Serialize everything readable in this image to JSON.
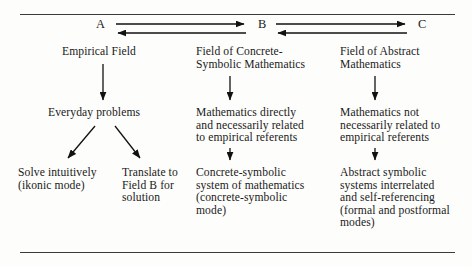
{
  "figure": {
    "axis_letters": [
      {
        "name": "A",
        "label": "A"
      },
      {
        "name": "B",
        "label": "B"
      },
      {
        "name": "C",
        "label": "C"
      }
    ],
    "columns": [
      {
        "key": "A",
        "nodes": [
          {
            "name": "empirical-field",
            "text": "Empirical Field"
          },
          {
            "name": "everyday-problems",
            "text": "Everyday problems"
          },
          {
            "name": "solve-intuitively",
            "text": "Solve intuitively\n(ikonic mode)"
          },
          {
            "name": "translate-to-field-b",
            "text": "Translate to\nField B for\nsolution"
          }
        ]
      },
      {
        "key": "B",
        "nodes": [
          {
            "name": "field-concrete-symbolic",
            "text": "Field of Concrete-\nSymbolic Mathematics"
          },
          {
            "name": "mathematics-directly-related",
            "text": "Mathematics directly\nand necessarily related\nto empirical referents"
          },
          {
            "name": "concrete-symbolic-system",
            "text": "Concrete-symbolic\nsystem of mathematics\n(concrete-symbolic\nmode)"
          }
        ]
      },
      {
        "key": "C",
        "nodes": [
          {
            "name": "field-abstract-mathematics",
            "text": "Field of Abstract\nMathematics"
          },
          {
            "name": "mathematics-not-necessarily-related",
            "text": "Mathematics not\nnecessarily related to\nempirical referents"
          },
          {
            "name": "abstract-symbolic-systems",
            "text": "Abstract symbolic\nsystems interrelated\nand self-referencing\n(formal and postformal\nmodes)"
          }
        ]
      }
    ],
    "colors": {
      "ink": "#1a1a1a",
      "rule": "#3b3b3b",
      "arrow": "#111111",
      "background": "#fdfdfb"
    }
  }
}
